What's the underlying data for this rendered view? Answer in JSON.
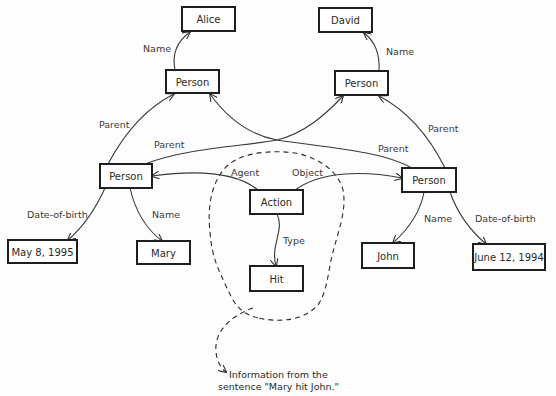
{
  "diagram": {
    "type": "semantic-network",
    "nodes": {
      "alice": {
        "label": "Alice",
        "x": 182,
        "y": 7,
        "w": 53,
        "h": 24
      },
      "david": {
        "label": "David",
        "x": 319,
        "y": 8,
        "w": 53,
        "h": 24
      },
      "person_top_left": {
        "label": "Person",
        "x": 166,
        "y": 70,
        "w": 53,
        "h": 23
      },
      "person_top_right": {
        "label": "Person",
        "x": 335,
        "y": 71,
        "w": 53,
        "h": 24
      },
      "person_mary": {
        "label": "Person",
        "x": 100,
        "y": 164,
        "w": 52,
        "h": 24
      },
      "person_john": {
        "label": "Person",
        "x": 402,
        "y": 168,
        "w": 54,
        "h": 24
      },
      "action": {
        "label": "Action",
        "x": 250,
        "y": 190,
        "w": 53,
        "h": 24
      },
      "hit": {
        "label": "Hit",
        "x": 250,
        "y": 266,
        "w": 53,
        "h": 25
      },
      "may_8_1995": {
        "label": "May 8, 1995",
        "x": 8,
        "y": 240,
        "w": 69,
        "h": 23
      },
      "mary": {
        "label": "Mary",
        "x": 137,
        "y": 241,
        "w": 53,
        "h": 23
      },
      "john": {
        "label": "John",
        "x": 362,
        "y": 243,
        "w": 52,
        "h": 25
      },
      "june_12_1994": {
        "label": "June 12, 1994",
        "x": 473,
        "y": 244,
        "w": 72,
        "h": 26
      }
    },
    "edges": {
      "name_alice": {
        "label": "Name",
        "from": "person_top_left",
        "to": "alice"
      },
      "name_david": {
        "label": "Name",
        "from": "person_top_right",
        "to": "david"
      },
      "parent_mary_to_tl": {
        "label": "Parent",
        "from": "person_mary",
        "to": "person_top_left"
      },
      "parent_mary_to_tr": {
        "label": "Parent",
        "from": "person_mary",
        "to": "person_top_right"
      },
      "parent_john_to_tl": {
        "label": "Parent",
        "from": "person_john",
        "to": "person_top_left"
      },
      "parent_john_to_tr": {
        "label": "Parent",
        "from": "person_john",
        "to": "person_top_right"
      },
      "agent": {
        "label": "Agent",
        "from": "action",
        "to": "person_mary"
      },
      "object": {
        "label": "Object",
        "from": "action",
        "to": "person_john"
      },
      "type": {
        "label": "Type",
        "from": "action",
        "to": "hit"
      },
      "dob_mary": {
        "label": "Date-of-birth",
        "from": "person_mary",
        "to": "may_8_1995"
      },
      "name_mary": {
        "label": "Name",
        "from": "person_mary",
        "to": "mary"
      },
      "name_john": {
        "label": "Name",
        "from": "person_john",
        "to": "john"
      },
      "dob_john": {
        "label": "Date-of-birth",
        "from": "person_john",
        "to": "june_12_1994"
      }
    },
    "annotation": {
      "line1": "Information from the",
      "line2": "sentence \"Mary hit John.\""
    },
    "colors": {
      "stroke": "#1e1e1e",
      "text": "#2a2a2a",
      "background": "#fdfdfd"
    }
  }
}
